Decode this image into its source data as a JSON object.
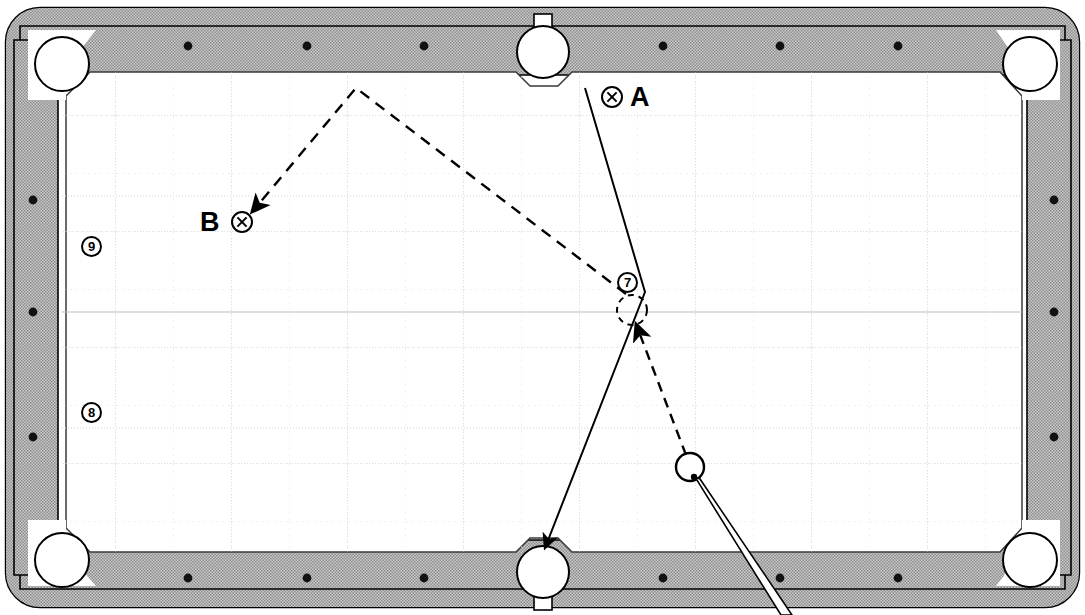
{
  "diagram": {
    "kind": "pool-table-shot-diagram",
    "width": 1085,
    "height": 615
  },
  "colors": {
    "rail": "#b4b4b4",
    "rail_dark": "#9a9a9a",
    "cloth": "#ffffff",
    "outline": "#000000",
    "grid_major": "#cfcfcf",
    "grid_minor": "#dddddd",
    "pocket_fill": "#ffffff",
    "cue_fill": "#ffffff"
  },
  "table": {
    "frame_label": "table-frame",
    "rail_label": "cushion-rail",
    "surface_label": "playing-surface",
    "diamond_count_long": 6,
    "diamond_count_short": 3
  },
  "pockets": [
    {
      "name": "pocket-top-left",
      "cx": 62,
      "cy": 64,
      "r": 27,
      "type": "corner"
    },
    {
      "name": "pocket-top-side",
      "cx": 543,
      "cy": 52,
      "r": 26,
      "type": "side"
    },
    {
      "name": "pocket-top-right",
      "cx": 1030,
      "cy": 64,
      "r": 27,
      "type": "corner"
    },
    {
      "name": "pocket-bottom-left",
      "cx": 62,
      "cy": 560,
      "r": 27,
      "type": "corner"
    },
    {
      "name": "pocket-bottom-side",
      "cx": 543,
      "cy": 572,
      "r": 26,
      "type": "side"
    },
    {
      "name": "pocket-bottom-right",
      "cx": 1030,
      "cy": 560,
      "r": 27,
      "type": "corner"
    }
  ],
  "balls": [
    {
      "name": "cue-ball",
      "label": "",
      "cx": 690,
      "cy": 467,
      "r": 14,
      "style": "solid"
    },
    {
      "name": "ghost-ball",
      "label": "",
      "cx": 632,
      "cy": 310,
      "r": 15,
      "style": "dashed"
    },
    {
      "name": "ball-7",
      "label": "7",
      "cx": 628,
      "cy": 283,
      "r": 11,
      "style": "numbered"
    },
    {
      "name": "ball-9",
      "label": "9",
      "cx": 92,
      "cy": 247,
      "r": 11,
      "style": "numbered"
    },
    {
      "name": "ball-8",
      "label": "8",
      "cx": 92,
      "cy": 413,
      "r": 11,
      "style": "numbered"
    }
  ],
  "markers": [
    {
      "name": "marker-a",
      "label": "A",
      "x_label": 630,
      "y_label": 84,
      "x_mark": 601,
      "y_mark": 86
    },
    {
      "name": "marker-b",
      "label": "B",
      "x_label": 200,
      "y_label": 209,
      "x_mark": 231,
      "y_mark": 211
    }
  ],
  "paths": {
    "solid": {
      "name": "object-ball-path",
      "style": "solid",
      "points": "585,88 645,292 545,552",
      "arrow_at": "545,552",
      "description": "Line from A down to the 7 ball then to the bottom side pocket"
    },
    "dashed_cue": {
      "name": "cue-ball-path-to-contact",
      "style": "dashed",
      "points": "690,460 634,318",
      "arrow_at": "634,318",
      "description": "Cue ball travels up-left to the ghost ball contact point"
    },
    "dashed_after": {
      "name": "cue-ball-path-after-contact",
      "style": "dashed",
      "points": "628,296 356,88 250,214",
      "arrow_at": "250,214",
      "description": "Cue ball rebounds off the top rail and finishes at position B"
    }
  },
  "cue_stick": {
    "name": "cue-stick",
    "tip_x": 697,
    "tip_y": 479,
    "butt_x": 788,
    "butt_y": 615,
    "tip_width": 3,
    "butt_width": 9
  },
  "legend": {
    "x_mark_meaning": "cue-ball-position",
    "dashed_meaning": "cue-ball-path",
    "solid_meaning": "object-ball-path"
  }
}
